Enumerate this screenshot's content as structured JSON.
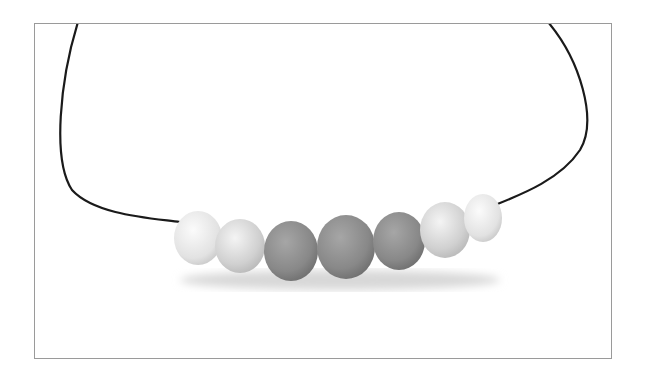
{
  "image": {
    "subject": "bead necklace on black cord",
    "background": "#ffffff",
    "frame_border": "#9a9a9a",
    "cord_color": "#1a1a1a",
    "beads": [
      {
        "cx": 198,
        "cy": 238,
        "rx": 24,
        "ry": 27,
        "fill": "#e6e6e6",
        "texture": "marbled"
      },
      {
        "cx": 240,
        "cy": 246,
        "rx": 25,
        "ry": 27,
        "fill": "#d2d2d2"
      },
      {
        "cx": 291,
        "cy": 251,
        "rx": 27,
        "ry": 30,
        "fill": "#8f8f8f"
      },
      {
        "cx": 346,
        "cy": 247,
        "rx": 29,
        "ry": 32,
        "fill": "#8a8a8a"
      },
      {
        "cx": 399,
        "cy": 241,
        "rx": 26,
        "ry": 29,
        "fill": "#8c8c8c"
      },
      {
        "cx": 445,
        "cy": 230,
        "rx": 25,
        "ry": 28,
        "fill": "#d4d4d4"
      },
      {
        "cx": 483,
        "cy": 218,
        "rx": 19,
        "ry": 24,
        "fill": "#ececec",
        "texture": "marbled"
      }
    ]
  }
}
